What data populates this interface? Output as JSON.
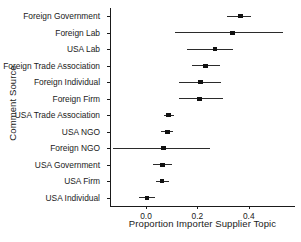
{
  "chart_data": {
    "type": "scatter",
    "title": "",
    "xlabel": "Proportion Importer Supplier Topic",
    "ylabel": "Comment Source",
    "xlim": [
      -0.14,
      0.58
    ],
    "xticks": [
      0.0,
      0.2,
      0.4
    ],
    "xticklabels": [
      "0.0",
      "0.2",
      "0.4"
    ],
    "grid": false,
    "legend": null,
    "orientation": "horizontal",
    "marker": "square",
    "error_bars": "confidence-interval",
    "categories": [
      "Foreign Government",
      "Foreign Lab",
      "USA Lab",
      "Foreign Trade Association",
      "Foreign Individual",
      "Foreign Firm",
      "USA Trade Association",
      "USA NGO",
      "Foreign NGO",
      "USA Government",
      "USA Firm",
      "USA Individual"
    ],
    "values": [
      0.368,
      0.336,
      0.268,
      0.232,
      0.212,
      0.208,
      0.088,
      0.084,
      0.068,
      0.064,
      0.062,
      0.005
    ],
    "ci_low": [
      0.316,
      0.112,
      0.16,
      0.18,
      0.128,
      0.128,
      0.072,
      0.06,
      -0.128,
      0.028,
      0.04,
      -0.028
    ],
    "ci_high": [
      0.408,
      0.532,
      0.34,
      0.288,
      0.292,
      0.3,
      0.108,
      0.104,
      0.248,
      0.1,
      0.088,
      0.034
    ],
    "points": [
      {
        "label": "Foreign Government",
        "value": 0.368,
        "low": 0.316,
        "high": 0.408
      },
      {
        "label": "Foreign Lab",
        "value": 0.336,
        "low": 0.112,
        "high": 0.532
      },
      {
        "label": "USA Lab",
        "value": 0.268,
        "low": 0.16,
        "high": 0.34
      },
      {
        "label": "Foreign Trade Association",
        "value": 0.232,
        "low": 0.18,
        "high": 0.288
      },
      {
        "label": "Foreign Individual",
        "value": 0.212,
        "low": 0.128,
        "high": 0.292
      },
      {
        "label": "Foreign Firm",
        "value": 0.208,
        "low": 0.128,
        "high": 0.3
      },
      {
        "label": "USA Trade Association",
        "value": 0.088,
        "low": 0.072,
        "high": 0.108
      },
      {
        "label": "USA NGO",
        "value": 0.084,
        "low": 0.06,
        "high": 0.104
      },
      {
        "label": "Foreign NGO",
        "value": 0.068,
        "low": -0.128,
        "high": 0.248
      },
      {
        "label": "USA Government",
        "value": 0.064,
        "low": 0.028,
        "high": 0.1
      },
      {
        "label": "USA Firm",
        "value": 0.062,
        "low": 0.04,
        "high": 0.088
      },
      {
        "label": "USA Individual",
        "value": 0.005,
        "low": -0.028,
        "high": 0.034
      }
    ],
    "colors": {
      "marker": "#111111",
      "line": "#2b2b2b",
      "axis": "#1a1a1a",
      "background": "#ffffff"
    }
  }
}
